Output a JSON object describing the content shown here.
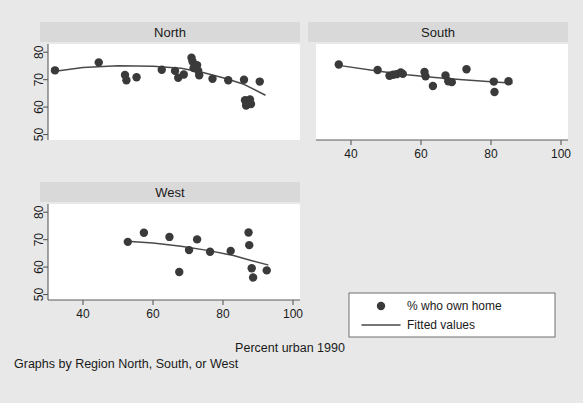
{
  "figure": {
    "background_color": "#e8e8e8",
    "panel_background_color": "#ffffff",
    "panel_title_background_color": "#d9d9d9",
    "marker_color": "#3a3a3a",
    "line_color": "#4a4a4a",
    "caption": "Graphs by Region North, South, or West",
    "x_axis_title": "Percent urban 1990"
  },
  "legend": {
    "marker_label": "% who own home",
    "line_label": "Fitted values"
  },
  "chart_data": {
    "type": "scatter",
    "title": "",
    "xlabel": "Percent urban 1990",
    "ylabel": "",
    "xlim": [
      30,
      102
    ],
    "ylim": [
      48,
      83
    ],
    "xticks": [
      40,
      60,
      80,
      100
    ],
    "yticks": [
      50,
      60,
      70,
      80
    ],
    "grid": false,
    "legend_position": "bottom-right",
    "panel_variable": "Region",
    "series_names": [
      "% who own home",
      "Fitted values"
    ],
    "panels": [
      {
        "label": "North",
        "points": [
          {
            "x": 32.0,
            "y": 73.4
          },
          {
            "x": 44.5,
            "y": 76.3
          },
          {
            "x": 52.0,
            "y": 71.7
          },
          {
            "x": 52.4,
            "y": 69.8
          },
          {
            "x": 55.3,
            "y": 70.9
          },
          {
            "x": 62.5,
            "y": 73.6
          },
          {
            "x": 66.3,
            "y": 73.2
          },
          {
            "x": 67.2,
            "y": 70.7
          },
          {
            "x": 68.8,
            "y": 71.9
          },
          {
            "x": 71.0,
            "y": 78.0
          },
          {
            "x": 71.3,
            "y": 76.6
          },
          {
            "x": 71.6,
            "y": 74.2
          },
          {
            "x": 72.6,
            "y": 75.3
          },
          {
            "x": 72.9,
            "y": 73.3
          },
          {
            "x": 73.2,
            "y": 71.6
          },
          {
            "x": 77.0,
            "y": 70.3
          },
          {
            "x": 81.5,
            "y": 69.8
          },
          {
            "x": 86.0,
            "y": 70.0
          },
          {
            "x": 86.3,
            "y": 62.5
          },
          {
            "x": 86.6,
            "y": 60.6
          },
          {
            "x": 87.7,
            "y": 62.8
          },
          {
            "x": 88.0,
            "y": 61.1
          },
          {
            "x": 90.5,
            "y": 69.3
          }
        ],
        "fit_line": [
          {
            "x": 31.0,
            "y": 72.9
          },
          {
            "x": 40.0,
            "y": 74.4
          },
          {
            "x": 50.0,
            "y": 75.1
          },
          {
            "x": 60.0,
            "y": 74.9
          },
          {
            "x": 68.0,
            "y": 74.2
          },
          {
            "x": 74.0,
            "y": 72.7
          },
          {
            "x": 80.0,
            "y": 70.7
          },
          {
            "x": 86.0,
            "y": 68.3
          },
          {
            "x": 92.0,
            "y": 64.4
          }
        ]
      },
      {
        "label": "South",
        "points": [
          {
            "x": 36.5,
            "y": 75.5
          },
          {
            "x": 47.6,
            "y": 73.5
          },
          {
            "x": 51.0,
            "y": 71.4
          },
          {
            "x": 52.0,
            "y": 71.8
          },
          {
            "x": 53.0,
            "y": 72.0
          },
          {
            "x": 54.2,
            "y": 72.6
          },
          {
            "x": 54.8,
            "y": 72.1
          },
          {
            "x": 61.0,
            "y": 72.8
          },
          {
            "x": 61.3,
            "y": 71.2
          },
          {
            "x": 63.4,
            "y": 67.7
          },
          {
            "x": 67.0,
            "y": 71.5
          },
          {
            "x": 67.8,
            "y": 69.4
          },
          {
            "x": 68.8,
            "y": 69.1
          },
          {
            "x": 73.0,
            "y": 73.8
          },
          {
            "x": 80.8,
            "y": 69.3
          },
          {
            "x": 81.0,
            "y": 65.5
          },
          {
            "x": 85.0,
            "y": 69.4
          }
        ],
        "fit_line": [
          {
            "x": 36.0,
            "y": 75.3
          },
          {
            "x": 48.0,
            "y": 73.1
          },
          {
            "x": 56.0,
            "y": 71.8
          },
          {
            "x": 64.0,
            "y": 70.8
          },
          {
            "x": 72.0,
            "y": 70.0
          },
          {
            "x": 80.0,
            "y": 69.2
          },
          {
            "x": 86.0,
            "y": 68.7
          }
        ]
      },
      {
        "label": "West",
        "points": [
          {
            "x": 52.8,
            "y": 69.2
          },
          {
            "x": 57.4,
            "y": 72.5
          },
          {
            "x": 64.7,
            "y": 71.0
          },
          {
            "x": 67.5,
            "y": 58.2
          },
          {
            "x": 70.3,
            "y": 66.2
          },
          {
            "x": 72.6,
            "y": 70.1
          },
          {
            "x": 76.3,
            "y": 65.6
          },
          {
            "x": 82.2,
            "y": 65.9
          },
          {
            "x": 87.3,
            "y": 72.6
          },
          {
            "x": 87.5,
            "y": 68.0
          },
          {
            "x": 88.2,
            "y": 59.6
          },
          {
            "x": 88.6,
            "y": 56.2
          },
          {
            "x": 92.5,
            "y": 58.8
          }
        ],
        "fit_line": [
          {
            "x": 52.5,
            "y": 69.4
          },
          {
            "x": 60.0,
            "y": 68.8
          },
          {
            "x": 68.0,
            "y": 67.6
          },
          {
            "x": 76.0,
            "y": 66.0
          },
          {
            "x": 83.0,
            "y": 64.2
          },
          {
            "x": 88.0,
            "y": 62.4
          },
          {
            "x": 92.8,
            "y": 60.8
          }
        ]
      }
    ]
  }
}
